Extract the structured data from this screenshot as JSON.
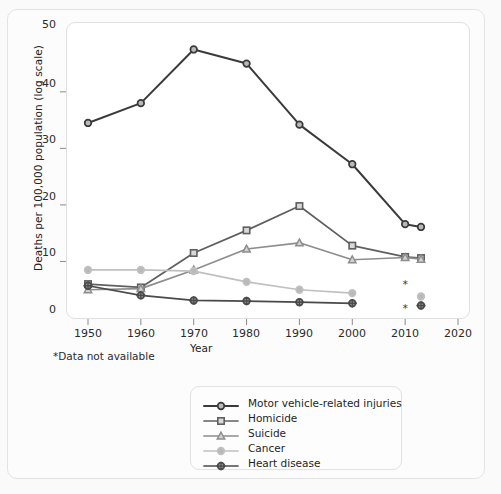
{
  "chart_data": {
    "type": "line",
    "title": "",
    "xlabel": "Year",
    "ylabel": "Deaths per 100,000 population (log scale)",
    "footnote": "*Data not available",
    "grid": false,
    "legend_position": "bottom",
    "xlim": [
      1945,
      2025
    ],
    "ylim": [
      0,
      52
    ],
    "x_ticks": [
      1950,
      1960,
      1970,
      1980,
      1990,
      2000,
      2010,
      2020
    ],
    "x_tick_labels": [
      "1950",
      "1960",
      "1970",
      "1980",
      "1990",
      "2000",
      "2010",
      "2020"
    ],
    "y_ticks": [
      0,
      10,
      20,
      30,
      40,
      50
    ],
    "y_tick_labels": [
      "0",
      "10",
      "20",
      "30",
      "40",
      "50"
    ],
    "x": [
      1950,
      1960,
      1970,
      1980,
      1990,
      2000,
      2010,
      2013
    ],
    "series": [
      {
        "name": "Motor vehicle-related injuries",
        "color": "#3a3a3a",
        "marker": "circle",
        "values": [
          34.5,
          38.0,
          47.5,
          45.0,
          34.2,
          27.2,
          16.6,
          16.1
        ]
      },
      {
        "name": "Homicide",
        "color": "#5f5f5f",
        "marker": "square",
        "values": [
          6.0,
          5.4,
          11.5,
          15.5,
          19.8,
          12.8,
          10.8,
          10.6
        ]
      },
      {
        "name": "Suicide",
        "color": "#8d8d8d",
        "marker": "triangle",
        "values": [
          5.0,
          5.2,
          8.5,
          12.2,
          13.3,
          10.3,
          10.7,
          10.4
        ]
      },
      {
        "name": "Cancer",
        "color": "#c0c0c0",
        "marker": "circle",
        "values": [
          8.5,
          8.5,
          8.3,
          6.4,
          5.0,
          4.4,
          null,
          3.8
        ]
      },
      {
        "name": "Heart disease",
        "color": "#4a4a4a",
        "marker": "star-circle",
        "values": [
          5.7,
          4.0,
          3.1,
          3.0,
          2.8,
          2.6,
          null,
          2.2
        ]
      }
    ],
    "annotations": [
      {
        "label": "*",
        "x": 2010,
        "y": 5.3,
        "note": "Cancer data not available 2010"
      },
      {
        "label": "*",
        "x": 2010,
        "y": 1.0,
        "note": "Heart disease data not available 2010"
      }
    ]
  },
  "axis": {
    "ylabel": "Deaths per 100,000 population (log scale)",
    "xlabel": "Year",
    "y_tick_labels": [
      "50",
      "40",
      "30",
      "20",
      "10",
      "0"
    ],
    "x_tick_labels": [
      "1950",
      "1960",
      "1970",
      "1980",
      "1990",
      "2000",
      "2010",
      "2020"
    ]
  },
  "footnote": {
    "text": "*Data not available"
  },
  "legend": {
    "items": [
      {
        "label": "Motor vehicle-related injuries"
      },
      {
        "label": "Homicide"
      },
      {
        "label": "Suicide"
      },
      {
        "label": "Cancer"
      },
      {
        "label": "Heart disease"
      }
    ]
  }
}
